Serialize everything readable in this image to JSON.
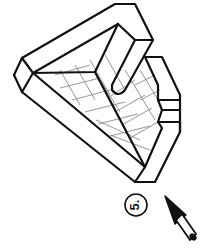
{
  "figure": {
    "type": "isometric-line-drawing",
    "step_label": "5.",
    "stroke_color": "#111111",
    "grid_color": "#8a8a8a",
    "background": "#ffffff",
    "icons": {
      "view_arrow": "view-direction-arrow-icon"
    }
  }
}
